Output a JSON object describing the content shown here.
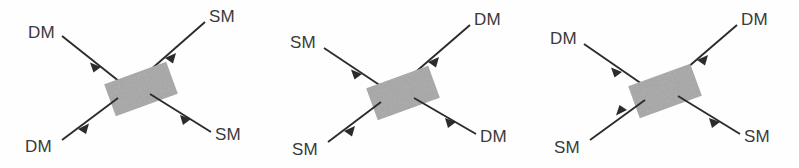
{
  "figure": {
    "background_color": "#fefefe",
    "line_color": "#2b2b2b",
    "label_color": "#3a3a3a",
    "box_fill": "#a5a5a5",
    "box_rotation_deg": -20,
    "panel_count": 3
  },
  "panels": [
    {
      "id": "panel-1",
      "name": "dm-sm-scattering",
      "process": "DM + SM -> DM + SM",
      "box": {
        "label": "",
        "fill": "#a5a5a5"
      },
      "legs": [
        {
          "position": "top-left",
          "label": "DM",
          "direction": "incoming",
          "arrow": "toward-box"
        },
        {
          "position": "top-right",
          "label": "SM",
          "direction": "incoming",
          "arrow": "toward-box"
        },
        {
          "position": "bottom-left",
          "label": "DM",
          "direction": "outgoing",
          "arrow": "away-from-box"
        },
        {
          "position": "bottom-right",
          "label": "SM",
          "direction": "outgoing",
          "arrow": "away-from-box"
        }
      ]
    },
    {
      "id": "panel-2",
      "name": "sm-dm-scattering",
      "process": "SM + DM -> SM + DM",
      "box": {
        "label": "",
        "fill": "#a5a5a5"
      },
      "legs": [
        {
          "position": "top-left",
          "label": "SM",
          "direction": "incoming",
          "arrow": "toward-box"
        },
        {
          "position": "top-right",
          "label": "DM",
          "direction": "incoming",
          "arrow": "toward-box"
        },
        {
          "position": "bottom-left",
          "label": "SM",
          "direction": "outgoing",
          "arrow": "away-from-box"
        },
        {
          "position": "bottom-right",
          "label": "DM",
          "direction": "outgoing",
          "arrow": "away-from-box"
        }
      ]
    },
    {
      "id": "panel-3",
      "name": "dm-annihilation",
      "process": "DM + DM -> SM + SM",
      "box": {
        "label": "",
        "fill": "#a5a5a5"
      },
      "legs": [
        {
          "position": "top-left",
          "label": "DM",
          "direction": "incoming",
          "arrow": "toward-box"
        },
        {
          "position": "top-right",
          "label": "DM",
          "direction": "incoming",
          "arrow": "toward-box"
        },
        {
          "position": "bottom-left",
          "label": "SM",
          "direction": "incoming",
          "arrow": "toward-box"
        },
        {
          "position": "bottom-right",
          "label": "SM",
          "direction": "outgoing",
          "arrow": "away-from-box"
        }
      ]
    }
  ]
}
